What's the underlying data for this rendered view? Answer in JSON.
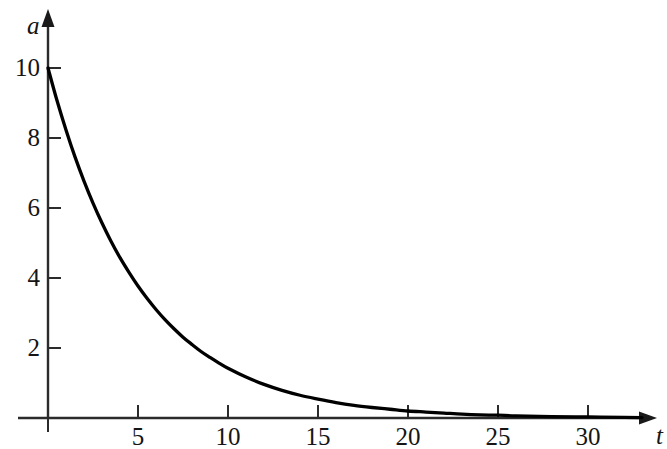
{
  "chart_data": {
    "type": "line",
    "title": "",
    "subtitle": "",
    "xlabel": "t",
    "ylabel": "a",
    "xlim": [
      0,
      33
    ],
    "ylim": [
      0,
      11
    ],
    "grid": false,
    "legend": null,
    "annotations": [],
    "x_ticks": [
      5,
      10,
      15,
      20,
      25,
      30
    ],
    "x_tick_labels": [
      "5",
      "10",
      "15",
      "20",
      "25",
      "30"
    ],
    "y_ticks": [
      2,
      4,
      6,
      8,
      10
    ],
    "y_tick_labels": [
      "2",
      "4",
      "6",
      "8",
      "10"
    ],
    "series": [
      {
        "name": "a(t)",
        "color": "#000000",
        "x": [
          0,
          0.5,
          1,
          1.5,
          2,
          2.5,
          3,
          3.5,
          4,
          4.5,
          5,
          5.5,
          6,
          6.5,
          7,
          7.5,
          8,
          8.5,
          9,
          9.5,
          10,
          11,
          12,
          13,
          14,
          15,
          16,
          17,
          18,
          19,
          20,
          21,
          22,
          23,
          24,
          25,
          26,
          28,
          30,
          32,
          33
        ],
        "values": [
          10,
          9.07,
          8.23,
          7.46,
          6.77,
          6.14,
          5.57,
          5.05,
          4.58,
          4.16,
          3.77,
          3.42,
          3.1,
          2.81,
          2.55,
          2.31,
          2.1,
          1.9,
          1.73,
          1.57,
          1.42,
          1.17,
          0.96,
          0.79,
          0.65,
          0.54,
          0.44,
          0.36,
          0.3,
          0.25,
          0.2,
          0.17,
          0.14,
          0.11,
          0.09,
          0.08,
          0.06,
          0.04,
          0.03,
          0.02,
          0.01
        ]
      }
    ]
  },
  "axes": {
    "y_axis_name": "a",
    "x_axis_name": "t",
    "y_tick_labels": [
      "10",
      "8",
      "6",
      "4",
      "2"
    ],
    "x_tick_labels": [
      "5",
      "10",
      "15",
      "20",
      "25",
      "30"
    ]
  },
  "colors": {
    "curve": "#000000",
    "axis": "#2b2b2b",
    "background": "#ffffff",
    "text": "#151515"
  }
}
